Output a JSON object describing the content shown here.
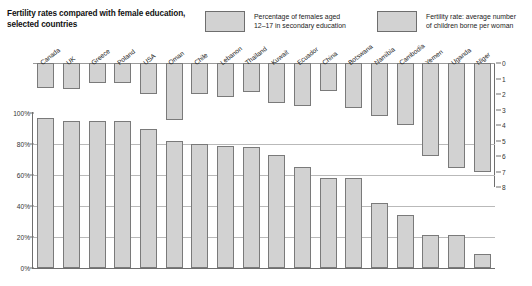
{
  "title": "Fertility rates compared with female\neducation, selected countries",
  "legend": {
    "items": [
      {
        "label": "Percentage of females aged\n12–17 in secondary education",
        "color": "#d2d2d2",
        "name": "legend-education"
      },
      {
        "label": "Fertility rate: average number\nof children borne per woman",
        "color": "#d2d2d2",
        "name": "legend-fertility"
      }
    ]
  },
  "axes": {
    "left_ticks": [
      "100%",
      "80%",
      "60%",
      "40%",
      "20%",
      "0%"
    ],
    "right_ticks": [
      "0",
      "1",
      "2",
      "3",
      "4",
      "5",
      "6",
      "7",
      "8"
    ]
  },
  "chart_data": {
    "type": "bar",
    "title": "Fertility rates compared with female education, selected countries",
    "xlabel": "",
    "ylabel": "Percentage of females aged 12–17 in secondary education",
    "y2label": "Fertility rate: average number of children borne per woman",
    "ylim": [
      0,
      100
    ],
    "y2lim": [
      0,
      8
    ],
    "y2_inverted": true,
    "grid": true,
    "legend_position": "top",
    "categories": [
      "Canada",
      "UK",
      "Greece",
      "Poland",
      "USA",
      "Oman",
      "Chile",
      "Lebanon",
      "Thailand",
      "Kuwait",
      "Ecuador",
      "China",
      "Botswana",
      "Namibia",
      "Cambodia",
      "Yemen",
      "Uganda",
      "Niger"
    ],
    "series": [
      {
        "name": "Percentage of females aged 12–17 in secondary education",
        "axis": "left",
        "unit": "%",
        "values": [
          97,
          95,
          95,
          95,
          90,
          82,
          80,
          79,
          78,
          73,
          65,
          58,
          58,
          42,
          34,
          21,
          21,
          9
        ]
      },
      {
        "name": "Fertility rate: average number of children borne per woman",
        "axis": "right",
        "unit": "children per woman",
        "values": [
          1.6,
          1.7,
          1.3,
          1.3,
          2.0,
          3.7,
          2.0,
          2.2,
          1.9,
          2.6,
          2.8,
          1.8,
          2.9,
          3.4,
          4.0,
          6.0,
          6.8,
          7.0
        ]
      }
    ]
  }
}
